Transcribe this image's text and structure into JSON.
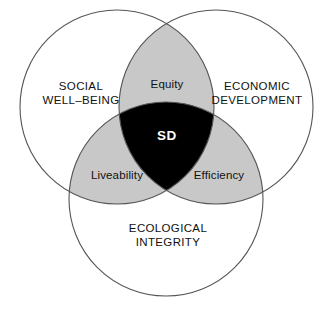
{
  "diagram": {
    "title_text": "",
    "type": "venn-3-circle",
    "colors": {
      "background": "#ffffff",
      "circle_fill": "#ffffff",
      "circle_stroke": "#555555",
      "pairwise_overlap_fill": "#c8c8c8",
      "center_overlap_fill": "#000000",
      "label_text": "#111111",
      "center_label_text": "#ffffff"
    },
    "circles": [
      {
        "name": "social-well-being",
        "cx": 117,
        "cy": 107,
        "r": 97
      },
      {
        "name": "economic-development",
        "cx": 216,
        "cy": 107,
        "r": 97
      },
      {
        "name": "ecological-integrity",
        "cx": 166,
        "cy": 199,
        "r": 97
      }
    ],
    "outer_labels": [
      {
        "id": "social",
        "text": "SOCIAL\nWELL–BEING"
      },
      {
        "id": "economic",
        "text": "ECONOMIC\nDEVELOPMENT"
      },
      {
        "id": "ecological",
        "text": "ECOLOGICAL\nINTEGRITY"
      }
    ],
    "overlap_labels": [
      {
        "id": "equity",
        "text": "Equity"
      },
      {
        "id": "liveability",
        "text": "Liveability"
      },
      {
        "id": "efficiency",
        "text": "Efficiency"
      }
    ],
    "center_label": {
      "id": "sd",
      "text": "SD"
    }
  }
}
